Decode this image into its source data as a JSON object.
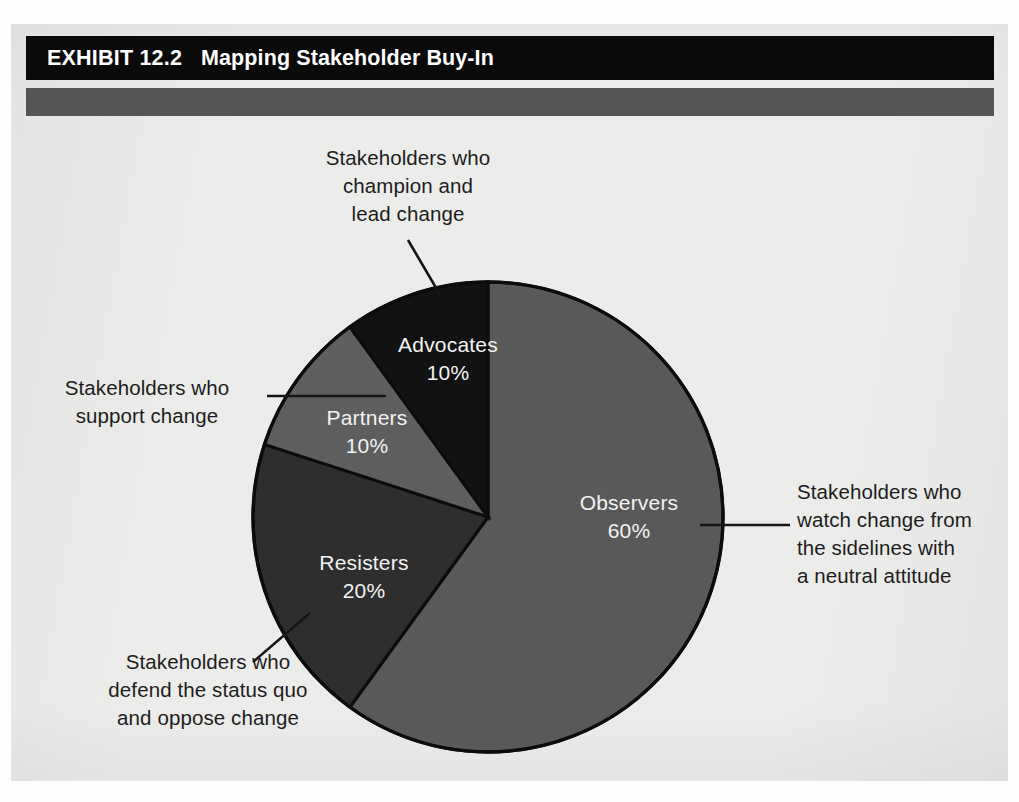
{
  "exhibit": {
    "label": "EXHIBIT 12.2",
    "title": "Mapping Stakeholder Buy-In"
  },
  "annotations": {
    "advocates": "Stakeholders who\nchampion and\nlead change",
    "partners": "Stakeholders who\nsupport change",
    "resisters": "Stakeholders who\ndefend the status quo\nand oppose change",
    "observers": "Stakeholders who\nwatch change from\nthe sidelines with\na neutral attitude"
  },
  "slice_labels": {
    "advocates": "Advocates\n10%",
    "partners": "Partners\n10%",
    "resisters": "Resisters\n20%",
    "observers": "Observers\n60%"
  },
  "colors": {
    "advocates": "#121212",
    "partners": "#5e5e5e",
    "resisters": "#2e2e2e",
    "observers": "#595959",
    "title_bar": "#0a0a0a",
    "sub_bar": "#555556",
    "paper": "#ececea",
    "outline": "#0c0c0c",
    "label_text": "#f2f2f2",
    "anno_text": "#1d1d1d"
  },
  "chart_data": {
    "type": "pie",
    "title": "Mapping Stakeholder Buy-In",
    "categories": [
      "Observers",
      "Resisters",
      "Partners",
      "Advocates"
    ],
    "values": [
      60,
      20,
      10,
      10
    ],
    "value_labels": [
      "60%",
      "20%",
      "10%",
      "10%"
    ],
    "units": "percent",
    "start_angle_deg": 0,
    "direction": "clockwise",
    "legend": "none",
    "slice_colors": [
      "#595959",
      "#2e2e2e",
      "#5e5e5e",
      "#121212"
    ],
    "descriptions": [
      "Stakeholders who watch change from the sidelines with a neutral attitude",
      "Stakeholders who defend the status quo and oppose change",
      "Stakeholders who support change",
      "Stakeholders who champion and lead change"
    ]
  }
}
